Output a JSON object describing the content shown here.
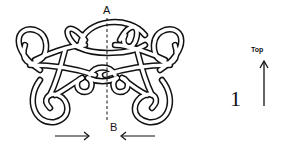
{
  "diagram": {
    "type": "knot-tying-instruction",
    "labels": {
      "top_point": "A",
      "bottom_point": "B"
    },
    "step": {
      "number": "1"
    },
    "orientation": {
      "label": "Top",
      "arrow": "up-arrow"
    },
    "pull_arrows": [
      {
        "direction": "right",
        "position": "bottom-left"
      },
      {
        "direction": "left",
        "position": "bottom-right"
      }
    ],
    "center_axis": {
      "style": "dashed",
      "from": "A",
      "to": "B"
    },
    "colors": {
      "stroke": "#111111",
      "fill": "#ffffff"
    }
  }
}
